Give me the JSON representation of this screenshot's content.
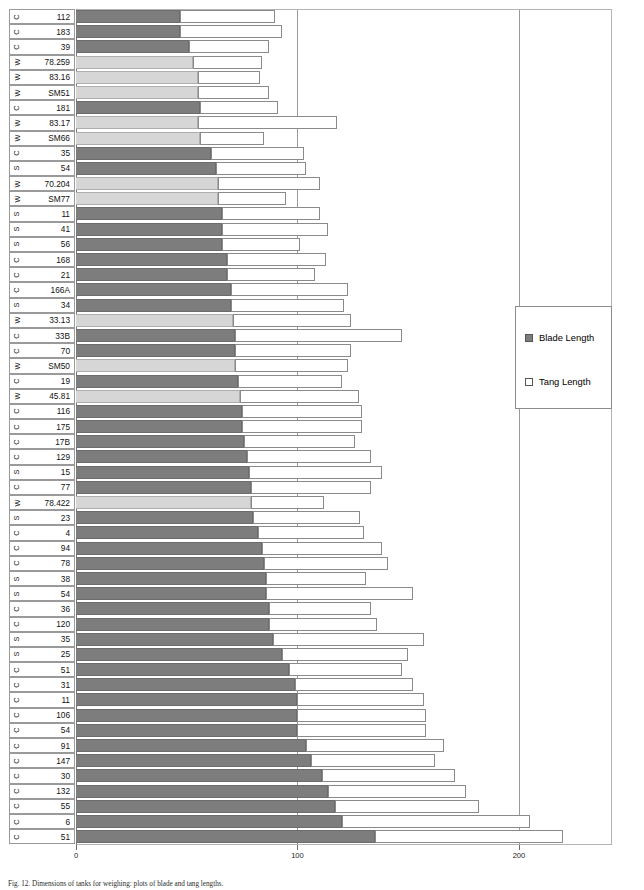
{
  "figure": {
    "caption": "Fig. 12.  Dimensions of tanks for weighing: plots of blade and tang lengths."
  },
  "legend": {
    "position": "right-middle",
    "items": [
      {
        "label": "Blade Length",
        "swatch": "blade",
        "color": "#7d7d7d"
      },
      {
        "label": "Tang Length",
        "swatch": "tang",
        "color": "#ffffff"
      }
    ]
  },
  "axis": {
    "ticks": [
      0,
      100,
      200
    ],
    "tick_labels": [
      "0",
      "100",
      "200"
    ],
    "xmin": 0,
    "xmax": 242,
    "gridlines": [
      100,
      200
    ]
  },
  "chart_data": {
    "type": "bar",
    "orientation": "horizontal",
    "stacked": true,
    "title": "",
    "xlabel": "",
    "ylabel": "",
    "xlim": [
      0,
      242
    ],
    "grid": true,
    "legend_position": "right",
    "series": [
      {
        "name": "Blade Length",
        "color": "#7d7d7d"
      },
      {
        "name": "Tang Length",
        "color": "#ffffff"
      }
    ],
    "categories": [
      {
        "prefix": "C",
        "id": "112",
        "blade": 47,
        "tang": 43
      },
      {
        "prefix": "C",
        "id": "183",
        "blade": 47,
        "tang": 46
      },
      {
        "prefix": "C",
        "id": "39",
        "blade": 51,
        "tang": 36
      },
      {
        "prefix": "W",
        "id": "78.259",
        "blade": 53,
        "tang": 31
      },
      {
        "prefix": "W",
        "id": "83.16",
        "blade": 55,
        "tang": 28
      },
      {
        "prefix": "W",
        "id": "SM51",
        "blade": 55,
        "tang": 32
      },
      {
        "prefix": "C",
        "id": "181",
        "blade": 56,
        "tang": 35
      },
      {
        "prefix": "W",
        "id": "83.17",
        "blade": 55,
        "tang": 63
      },
      {
        "prefix": "W",
        "id": "SM66",
        "blade": 56,
        "tang": 29
      },
      {
        "prefix": "C",
        "id": "35",
        "blade": 61,
        "tang": 42
      },
      {
        "prefix": "S",
        "id": "54",
        "blade": 63,
        "tang": 41
      },
      {
        "prefix": "W",
        "id": "70.204",
        "blade": 64,
        "tang": 46
      },
      {
        "prefix": "W",
        "id": "SM77",
        "blade": 64,
        "tang": 31
      },
      {
        "prefix": "S",
        "id": "11",
        "blade": 66,
        "tang": 44
      },
      {
        "prefix": "S",
        "id": "41",
        "blade": 66,
        "tang": 48
      },
      {
        "prefix": "S",
        "id": "56",
        "blade": 66,
        "tang": 35
      },
      {
        "prefix": "C",
        "id": "168",
        "blade": 68,
        "tang": 45
      },
      {
        "prefix": "C",
        "id": "21",
        "blade": 68,
        "tang": 40
      },
      {
        "prefix": "C",
        "id": "166A",
        "blade": 70,
        "tang": 53
      },
      {
        "prefix": "S",
        "id": "34",
        "blade": 70,
        "tang": 51
      },
      {
        "prefix": "W",
        "id": "33.13",
        "blade": 71,
        "tang": 53
      },
      {
        "prefix": "C",
        "id": "33B",
        "blade": 72,
        "tang": 75
      },
      {
        "prefix": "C",
        "id": "70",
        "blade": 72,
        "tang": 52
      },
      {
        "prefix": "W",
        "id": "SM50",
        "blade": 72,
        "tang": 51
      },
      {
        "prefix": "C",
        "id": "19",
        "blade": 73,
        "tang": 47
      },
      {
        "prefix": "W",
        "id": "45.81",
        "blade": 74,
        "tang": 54
      },
      {
        "prefix": "C",
        "id": "116",
        "blade": 75,
        "tang": 54
      },
      {
        "prefix": "C",
        "id": "175",
        "blade": 75,
        "tang": 54
      },
      {
        "prefix": "C",
        "id": "17B",
        "blade": 76,
        "tang": 50
      },
      {
        "prefix": "C",
        "id": "129",
        "blade": 77,
        "tang": 56
      },
      {
        "prefix": "S",
        "id": "15",
        "blade": 78,
        "tang": 60
      },
      {
        "prefix": "C",
        "id": "77",
        "blade": 79,
        "tang": 54
      },
      {
        "prefix": "W",
        "id": "78.422",
        "blade": 79,
        "tang": 33
      },
      {
        "prefix": "S",
        "id": "23",
        "blade": 80,
        "tang": 48
      },
      {
        "prefix": "C",
        "id": "4",
        "blade": 82,
        "tang": 48
      },
      {
        "prefix": "C",
        "id": "94",
        "blade": 84,
        "tang": 54
      },
      {
        "prefix": "C",
        "id": "78",
        "blade": 85,
        "tang": 56
      },
      {
        "prefix": "S",
        "id": "38",
        "blade": 86,
        "tang": 45
      },
      {
        "prefix": "S",
        "id": "54",
        "blade": 86,
        "tang": 66
      },
      {
        "prefix": "C",
        "id": "36",
        "blade": 87,
        "tang": 46
      },
      {
        "prefix": "C",
        "id": "120",
        "blade": 87,
        "tang": 49
      },
      {
        "prefix": "S",
        "id": "35",
        "blade": 89,
        "tang": 68
      },
      {
        "prefix": "S",
        "id": "25",
        "blade": 93,
        "tang": 57
      },
      {
        "prefix": "C",
        "id": "51",
        "blade": 96,
        "tang": 51
      },
      {
        "prefix": "C",
        "id": "31",
        "blade": 99,
        "tang": 53
      },
      {
        "prefix": "C",
        "id": "11",
        "blade": 100,
        "tang": 57
      },
      {
        "prefix": "C",
        "id": "106",
        "blade": 100,
        "tang": 58
      },
      {
        "prefix": "C",
        "id": "54",
        "blade": 100,
        "tang": 58
      },
      {
        "prefix": "C",
        "id": "91",
        "blade": 104,
        "tang": 62
      },
      {
        "prefix": "C",
        "id": "147",
        "blade": 106,
        "tang": 56
      },
      {
        "prefix": "C",
        "id": "30",
        "blade": 111,
        "tang": 60
      },
      {
        "prefix": "C",
        "id": "132",
        "blade": 114,
        "tang": 62
      },
      {
        "prefix": "C",
        "id": "55",
        "blade": 117,
        "tang": 65
      },
      {
        "prefix": "C",
        "id": "6",
        "blade": 120,
        "tang": 85
      },
      {
        "prefix": "C",
        "id": "51",
        "blade": 135,
        "tang": 85
      }
    ]
  }
}
